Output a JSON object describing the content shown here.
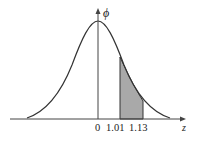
{
  "diagram": {
    "type": "normal-distribution-curve",
    "y_axis_label": "ϕ",
    "x_axis_label": "z",
    "tick_labels": [
      "0",
      "1.01",
      "1.13"
    ],
    "shaded_region": {
      "from": 1.01,
      "to": 1.13
    },
    "colors": {
      "curve": "#333333",
      "shade": "#a9a9a9",
      "axis": "#444444"
    }
  }
}
